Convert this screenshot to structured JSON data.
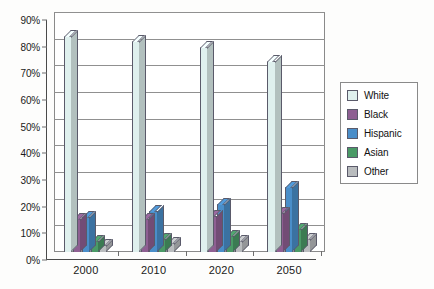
{
  "chart_data": {
    "type": "bar",
    "title": "",
    "subtitle": "",
    "xlabel": "",
    "ylabel": "",
    "categories": [
      "2000",
      "2010",
      "2020",
      "2050"
    ],
    "ylim": [
      0,
      90
    ],
    "ytick_values": [
      0,
      10,
      20,
      30,
      40,
      50,
      60,
      70,
      80,
      90
    ],
    "ytick_labels": [
      "0%",
      "10%",
      "20%",
      "30%",
      "40%",
      "50%",
      "60%",
      "70%",
      "80%",
      "90%"
    ],
    "grid": true,
    "legend_position": "right",
    "style": "3d-column",
    "series": [
      {
        "name": "White",
        "color": "#dff0ee",
        "values": [
          81,
          79,
          77,
          71.5
        ]
      },
      {
        "name": "Black",
        "color": "#8e5f92",
        "values": [
          12.5,
          12.5,
          13.5,
          14.5
        ]
      },
      {
        "name": "Hispanic",
        "color": "#4a8ec9",
        "values": [
          13,
          15.5,
          18,
          24.5
        ]
      },
      {
        "name": "Asian",
        "color": "#4a9a66",
        "values": [
          4,
          5,
          6,
          8.5
        ]
      },
      {
        "name": "Other",
        "color": "#b9bcbe",
        "values": [
          2.5,
          3.5,
          4,
          5
        ]
      }
    ]
  },
  "legend": {
    "items": [
      {
        "label": "White"
      },
      {
        "label": "Black"
      },
      {
        "label": "Hispanic"
      },
      {
        "label": "Asian"
      },
      {
        "label": "Other"
      }
    ]
  },
  "colors": {
    "white_series": "#dff0ee",
    "black_series": "#8e5f92",
    "hispanic_series": "#4a8ec9",
    "asian_series": "#4a9a66",
    "other_series": "#b9bcbe",
    "axis": "#4a4a4a",
    "grid": "#909090"
  }
}
